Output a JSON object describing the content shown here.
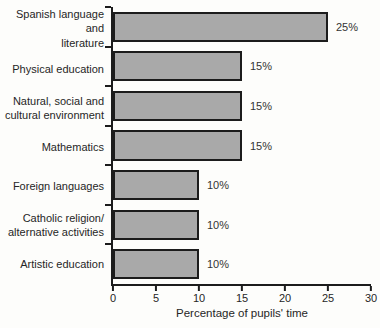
{
  "chart_data": {
    "type": "bar",
    "orientation": "horizontal",
    "title": "",
    "xlabel": "Percentage of pupils' time",
    "ylabel": "",
    "xlim": [
      0,
      30
    ],
    "xticks": [
      0,
      5,
      10,
      15,
      20,
      25,
      30
    ],
    "grid": false,
    "legend": "none",
    "bar_color": "#a9a9a9",
    "bar_border_color": "#1c1c1c",
    "axis_color": "#1c1c1c",
    "categories": [
      "Spanish language and\nliterature",
      "Physical education",
      "Natural, social and\ncultural environment",
      "Mathematics",
      "Foreign languages",
      "Catholic religion/\nalternative activities",
      "Artistic education"
    ],
    "values": [
      25,
      15,
      15,
      15,
      10,
      10,
      10
    ],
    "value_labels": [
      "25%",
      "15%",
      "15%",
      "15%",
      "10%",
      "10%",
      "10%"
    ]
  }
}
